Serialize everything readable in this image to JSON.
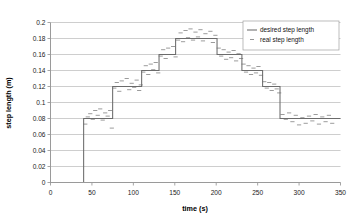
{
  "chart_data": {
    "type": "line",
    "title": "",
    "xlabel": "time (s)",
    "ylabel": "step length (m)",
    "xlim": [
      0,
      350
    ],
    "ylim": [
      0,
      0.2
    ],
    "grid": true,
    "legend_position": "top-right",
    "xticks": [
      0,
      50,
      100,
      150,
      200,
      250,
      300,
      350
    ],
    "xtick_labels": [
      "0",
      "50",
      "100",
      "150",
      "200",
      "250",
      "300",
      "350"
    ],
    "yticks": [
      0,
      0.02,
      0.04,
      0.06,
      0.08,
      0.1,
      0.12,
      0.14,
      0.16,
      0.18,
      0.2
    ],
    "ytick_labels": [
      "0",
      "0.02",
      "0.04",
      "0.06",
      "0.08",
      "0.1",
      "0.12",
      "0.14",
      "0.16",
      "0.18",
      "0.2"
    ],
    "series": [
      {
        "name": "desired step length",
        "style": "step",
        "color": "#6b6b6b",
        "points": [
          [
            0,
            0
          ],
          [
            40,
            0
          ],
          [
            40,
            0.08
          ],
          [
            75,
            0.08
          ],
          [
            75,
            0.12
          ],
          [
            110,
            0.12
          ],
          [
            110,
            0.14
          ],
          [
            131,
            0.14
          ],
          [
            131,
            0.16
          ],
          [
            151,
            0.16
          ],
          [
            151,
            0.18
          ],
          [
            201,
            0.18
          ],
          [
            201,
            0.16
          ],
          [
            231,
            0.16
          ],
          [
            231,
            0.14
          ],
          [
            256,
            0.14
          ],
          [
            256,
            0.12
          ],
          [
            277,
            0.12
          ],
          [
            277,
            0.08
          ],
          [
            350,
            0.08
          ]
        ]
      },
      {
        "name": "real step length",
        "style": "dashes",
        "color": "#8a8a8a",
        "points": [
          [
            42,
            0.073
          ],
          [
            45,
            0.082
          ],
          [
            48,
            0.086
          ],
          [
            51,
            0.079
          ],
          [
            54,
            0.09
          ],
          [
            57,
            0.084
          ],
          [
            60,
            0.092
          ],
          [
            63,
            0.078
          ],
          [
            66,
            0.087
          ],
          [
            69,
            0.083
          ],
          [
            72,
            0.09
          ],
          [
            74,
            0.068
          ],
          [
            77,
            0.118
          ],
          [
            80,
            0.125
          ],
          [
            83,
            0.114
          ],
          [
            86,
            0.127
          ],
          [
            89,
            0.12
          ],
          [
            92,
            0.13
          ],
          [
            95,
            0.116
          ],
          [
            98,
            0.124
          ],
          [
            101,
            0.119
          ],
          [
            104,
            0.128
          ],
          [
            107,
            0.115
          ],
          [
            109,
            0.122
          ],
          [
            112,
            0.138
          ],
          [
            115,
            0.146
          ],
          [
            118,
            0.135
          ],
          [
            121,
            0.148
          ],
          [
            124,
            0.141
          ],
          [
            127,
            0.15
          ],
          [
            130,
            0.137
          ],
          [
            133,
            0.158
          ],
          [
            136,
            0.166
          ],
          [
            139,
            0.155
          ],
          [
            142,
            0.168
          ],
          [
            145,
            0.16
          ],
          [
            148,
            0.17
          ],
          [
            151,
            0.157
          ],
          [
            154,
            0.178
          ],
          [
            157,
            0.187
          ],
          [
            160,
            0.176
          ],
          [
            163,
            0.19
          ],
          [
            166,
            0.181
          ],
          [
            169,
            0.192
          ],
          [
            172,
            0.178
          ],
          [
            175,
            0.188
          ],
          [
            178,
            0.182
          ],
          [
            181,
            0.191
          ],
          [
            184,
            0.177
          ],
          [
            187,
            0.186
          ],
          [
            190,
            0.18
          ],
          [
            193,
            0.189
          ],
          [
            196,
            0.175
          ],
          [
            199,
            0.184
          ],
          [
            203,
            0.168
          ],
          [
            206,
            0.158
          ],
          [
            209,
            0.166
          ],
          [
            212,
            0.154
          ],
          [
            215,
            0.163
          ],
          [
            218,
            0.156
          ],
          [
            221,
            0.165
          ],
          [
            224,
            0.152
          ],
          [
            227,
            0.161
          ],
          [
            230,
            0.155
          ],
          [
            233,
            0.148
          ],
          [
            236,
            0.138
          ],
          [
            239,
            0.146
          ],
          [
            242,
            0.135
          ],
          [
            245,
            0.143
          ],
          [
            248,
            0.137
          ],
          [
            251,
            0.145
          ],
          [
            254,
            0.134
          ],
          [
            258,
            0.126
          ],
          [
            261,
            0.118
          ],
          [
            264,
            0.125
          ],
          [
            267,
            0.115
          ],
          [
            270,
            0.123
          ],
          [
            273,
            0.117
          ],
          [
            276,
            0.112
          ],
          [
            280,
            0.085
          ],
          [
            284,
            0.079
          ],
          [
            288,
            0.087
          ],
          [
            292,
            0.076
          ],
          [
            296,
            0.084
          ],
          [
            300,
            0.072
          ],
          [
            304,
            0.081
          ],
          [
            308,
            0.074
          ],
          [
            312,
            0.083
          ],
          [
            316,
            0.077
          ],
          [
            320,
            0.085
          ],
          [
            324,
            0.073
          ],
          [
            328,
            0.082
          ],
          [
            332,
            0.076
          ],
          [
            336,
            0.084
          ],
          [
            340,
            0.074
          ],
          [
            344,
            0.08
          ]
        ]
      }
    ],
    "legend": [
      {
        "label": "desired step length",
        "marker": "line",
        "color": "#6b6b6b"
      },
      {
        "label": "real step length",
        "marker": "dash",
        "color": "#8a8a8a"
      }
    ]
  }
}
